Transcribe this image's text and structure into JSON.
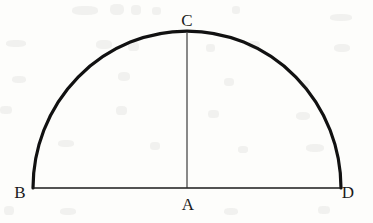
{
  "figure": {
    "kind": "geometry-diagram",
    "canvas": {
      "width": 373,
      "height": 223
    },
    "background_color": "#fdfdfb",
    "stroke_color": "#111111",
    "label_color": "#1b1b1b",
    "points": [
      {
        "id": "B",
        "label": "B",
        "x": 33,
        "y": 188,
        "label_x": 20,
        "label_y": 192
      },
      {
        "id": "C",
        "label": "C",
        "x": 187,
        "y": 31,
        "label_x": 187,
        "label_y": 20
      },
      {
        "id": "A",
        "label": "A",
        "x": 187,
        "y": 188,
        "label_x": 188,
        "label_y": 204
      },
      {
        "id": "D",
        "label": "D",
        "x": 341,
        "y": 188,
        "label_x": 348,
        "label_y": 192
      }
    ],
    "strokes": {
      "arc_width": 3.2,
      "baseline_width": 1.6,
      "radius_width": 1.1
    },
    "paths": {
      "arc": "M 33 188 A 154 157 0 0 1 341 188",
      "baseline": "M 33 188 L 341 188",
      "radius": "M 187 33 L 187 188"
    }
  }
}
